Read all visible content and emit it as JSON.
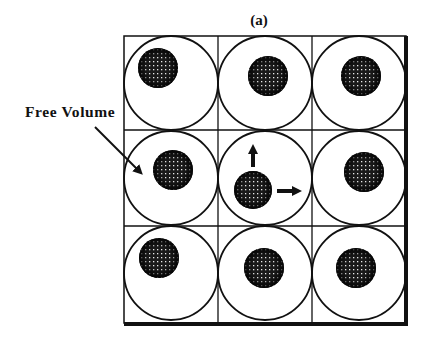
{
  "figure": {
    "panel_label": "(a)",
    "annotation_label": "Free Volume",
    "grid": {
      "rows": 3,
      "cols": 3
    },
    "colors": {
      "line": "#111111",
      "particle": "#1a1a1a",
      "speckle": "#e8e8e8",
      "background": "#ffffff"
    },
    "cells": [
      {
        "row": 0,
        "col": 0,
        "particle": [
          158,
          68
        ]
      },
      {
        "row": 0,
        "col": 1,
        "particle": [
          268,
          76
        ]
      },
      {
        "row": 0,
        "col": 2,
        "particle": [
          361,
          76
        ]
      },
      {
        "row": 1,
        "col": 0,
        "particle": [
          173,
          170
        ]
      },
      {
        "row": 1,
        "col": 1,
        "particle": [
          253,
          190
        ],
        "arrows": [
          "up",
          "right"
        ]
      },
      {
        "row": 1,
        "col": 2,
        "particle": [
          364,
          172
        ]
      },
      {
        "row": 2,
        "col": 0,
        "particle": [
          159,
          258
        ]
      },
      {
        "row": 2,
        "col": 1,
        "particle": [
          264,
          268
        ]
      },
      {
        "row": 2,
        "col": 2,
        "particle": [
          356,
          268
        ]
      }
    ]
  }
}
